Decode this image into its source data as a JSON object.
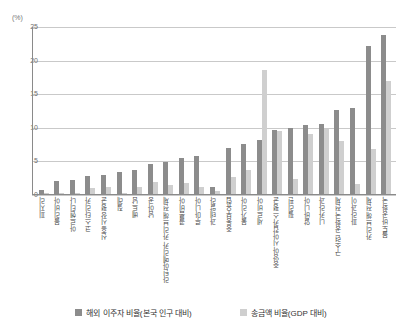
{
  "chart_data": {
    "type": "bar",
    "title": "",
    "subtitle": "",
    "xlabel": "",
    "ylabel": "",
    "unit_label": "(%)",
    "ylim": [
      0,
      25
    ],
    "yticks": [
      0,
      5,
      10,
      15,
      20,
      25
    ],
    "ytick_labels": [
      "0",
      "5",
      "10",
      "15",
      "20",
      "25"
    ],
    "grid": true,
    "legend_position": "bottom",
    "categories": [
      "피지리",
      "볼리비아",
      "아르헨티나",
      "코스타리카",
      "신흥시장 평균",
      "칠레",
      "베트남",
      "남아공",
      "라틴아메리카 카리브해 전체",
      "콜롬비아",
      "루마니아",
      "과테말라",
      "중동부유럽",
      "불가리아",
      "세르비아",
      "중앙아시아캅카스 평균",
      "필리핀",
      "알바니아",
      "니카라과",
      "구소련 공화국 전체",
      "파라과이",
      "카리브해 전체",
      "몰도바공화국"
    ],
    "series": [
      {
        "name": "해외 이주자 비율(본국 인구 대비)",
        "color": "#8c8c8c",
        "values": [
          0.6,
          1.9,
          2.1,
          2.7,
          2.9,
          3.3,
          3.6,
          4.5,
          4.8,
          5.3,
          5.6,
          1.0,
          6.8,
          7.4,
          8.0,
          9.6,
          9.8,
          10.2,
          10.4,
          12.5,
          12.8,
          22.0,
          23.7
        ]
      },
      {
        "name": "송금액 비율(GDP 대비)",
        "color": "#cfcfcf",
        "values": [
          0.05,
          0.05,
          0.05,
          0.9,
          1.1,
          0.05,
          1.0,
          1.8,
          1.3,
          1.6,
          1.1,
          0.4,
          2.5,
          3.5,
          18.4,
          9.4,
          2.2,
          8.9,
          9.7,
          7.9,
          1.5,
          6.7,
          16.8
        ]
      }
    ]
  },
  "legend": {
    "items": [
      {
        "label": "해외 이주자 비율(본국 인구 대비)",
        "swatch": "dark-gray-swatch"
      },
      {
        "label": "송금액 비율(GDP 대비)",
        "swatch": "light-gray-swatch"
      }
    ]
  }
}
